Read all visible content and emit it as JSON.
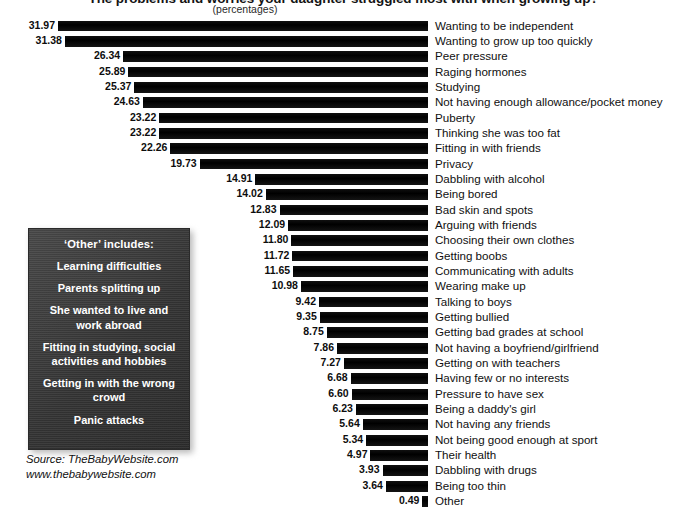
{
  "header": {
    "title": "The problems and worries your daughter struggled most with when growing up?",
    "subtitle": "(percentages)"
  },
  "source": {
    "line1": "Source: TheBabyWebsite.com",
    "line2": "www.thebabywebsite.com"
  },
  "callout": {
    "title": "‘Other’ includes:",
    "items": [
      "Learning difficulties",
      "Parents splitting up",
      "She wanted to live and work abroad",
      "Fitting in studying, social activities and hobbies",
      "Getting in with the wrong crowd",
      "Panic attacks"
    ]
  },
  "colors": {
    "bar": "#0a0a0a",
    "text": "#101010",
    "callout_bg": "#3c3c3c",
    "callout_text": "#ffffff",
    "page_bg": "#ffffff"
  },
  "chart_data": {
    "type": "bar",
    "orientation": "horizontal",
    "title": "The problems and worries your daughter struggled most with when growing up?",
    "subtitle": "(percentages)",
    "xlabel": "",
    "ylabel": "",
    "xlim": [
      0,
      31.97
    ],
    "grid": false,
    "legend": false,
    "value_suffix": "%",
    "bars_right_aligned": true,
    "categories": [
      "Wanting to be independent",
      "Wanting to grow up too quickly",
      "Peer pressure",
      "Raging hormones",
      "Studying",
      "Not having enough allowance/pocket money",
      "Puberty",
      "Thinking she was too fat",
      "Fitting in with friends",
      "Privacy",
      "Dabbling with alcohol",
      "Being bored",
      "Bad skin and spots",
      "Arguing with friends",
      "Choosing their own clothes",
      "Getting boobs",
      "Communicating with adults",
      "Wearing make up",
      "Talking to boys",
      "Getting bullied",
      "Getting bad grades at school",
      "Not having a boyfriend/girlfriend",
      "Getting on with teachers",
      "Having few or no interests",
      "Pressure to have sex",
      "Being a daddy's girl",
      "Not having any friends",
      "Not being good enough at sport",
      "Their health",
      "Dabbling with drugs",
      "Being too thin",
      "Other"
    ],
    "values": [
      31.97,
      31.38,
      26.34,
      25.89,
      25.37,
      24.63,
      23.22,
      23.22,
      22.26,
      19.73,
      14.91,
      14.02,
      12.83,
      12.09,
      11.8,
      11.72,
      11.65,
      10.98,
      9.42,
      9.35,
      8.75,
      7.86,
      7.27,
      6.68,
      6.6,
      6.23,
      5.64,
      5.34,
      4.97,
      3.93,
      3.64,
      0.49
    ],
    "value_labels": [
      "31.97",
      "31.38",
      "26.34",
      "25.89",
      "25.37",
      "24.63",
      "23.22",
      "23.22",
      "22.26",
      "19.73",
      "14.91",
      "14.02",
      "12.83",
      "12.09",
      "11.80",
      "11.72",
      "11.65",
      "10.98",
      "9.42",
      "9.35",
      "8.75",
      "7.86",
      "7.27",
      "6.68",
      "6.60",
      "6.23",
      "5.64",
      "5.34",
      "4.97",
      "3.93",
      "3.64",
      "0.49"
    ]
  }
}
